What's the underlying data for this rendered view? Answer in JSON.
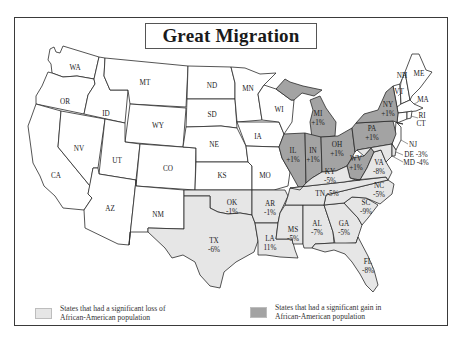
{
  "title": "Great Migration",
  "colors": {
    "loss_fill": "#e6e6e6",
    "gain_fill": "#a3a3a3",
    "neutral_fill": "#ffffff",
    "border": "#2a2a2a"
  },
  "legend": {
    "loss": {
      "line1": "States that had a significant loss of",
      "line2": "African-American population"
    },
    "gain": {
      "line1": "States that had a significant gain in",
      "line2": "African-American population"
    }
  },
  "states": {
    "WA": {
      "abbr": "WA",
      "change": ""
    },
    "OR": {
      "abbr": "OR",
      "change": ""
    },
    "CA": {
      "abbr": "CA",
      "change": ""
    },
    "ID": {
      "abbr": "ID",
      "change": ""
    },
    "NV": {
      "abbr": "NV",
      "change": ""
    },
    "MT": {
      "abbr": "MT",
      "change": ""
    },
    "WY": {
      "abbr": "WY",
      "change": ""
    },
    "UT": {
      "abbr": "UT",
      "change": ""
    },
    "AZ": {
      "abbr": "AZ",
      "change": ""
    },
    "CO": {
      "abbr": "CO",
      "change": ""
    },
    "NM": {
      "abbr": "NM",
      "change": ""
    },
    "ND": {
      "abbr": "ND",
      "change": ""
    },
    "SD": {
      "abbr": "SD",
      "change": ""
    },
    "NE": {
      "abbr": "NE",
      "change": ""
    },
    "KS": {
      "abbr": "KS",
      "change": ""
    },
    "MN": {
      "abbr": "MN",
      "change": ""
    },
    "IA": {
      "abbr": "IA",
      "change": ""
    },
    "MO": {
      "abbr": "MO",
      "change": ""
    },
    "WI": {
      "abbr": "WI",
      "change": ""
    },
    "OK": {
      "abbr": "OK",
      "change": "-1%"
    },
    "TX": {
      "abbr": "TX",
      "change": "-6%"
    },
    "AR": {
      "abbr": "AR",
      "change": "-1%"
    },
    "LA": {
      "abbr": "LA",
      "change": "11%"
    },
    "MS": {
      "abbr": "MS",
      "change": "-5%"
    },
    "AL": {
      "abbr": "AL",
      "change": "-7%"
    },
    "GA": {
      "abbr": "GA",
      "change": "-5%"
    },
    "FL": {
      "abbr": "FL",
      "change": "-8%"
    },
    "SC": {
      "abbr": "SC",
      "change": "-9%"
    },
    "NC": {
      "abbr": "NC",
      "change": "-5%"
    },
    "TN": {
      "abbr": "TN",
      "change": "-5%"
    },
    "KY": {
      "abbr": "KY",
      "change": "-5%"
    },
    "VA": {
      "abbr": "VA",
      "change": "-8%"
    },
    "IL": {
      "abbr": "IL",
      "change": "+1%"
    },
    "IN": {
      "abbr": "IN",
      "change": "+1%"
    },
    "MI": {
      "abbr": "MI",
      "change": "+1%"
    },
    "OH": {
      "abbr": "OH",
      "change": "+1%"
    },
    "WV": {
      "abbr": "WV",
      "change": "+1%"
    },
    "PA": {
      "abbr": "PA",
      "change": "+1%"
    },
    "NY": {
      "abbr": "NY",
      "change": "+1%"
    },
    "NJ": {
      "abbr": "NJ",
      "change": ""
    },
    "DE": {
      "abbr": "DE",
      "change": "-3%"
    },
    "MD": {
      "abbr": "MD",
      "change": "-4%"
    },
    "VT": {
      "abbr": "VT",
      "change": ""
    },
    "NH": {
      "abbr": "NH",
      "change": ""
    },
    "ME": {
      "abbr": "ME",
      "change": ""
    },
    "MA": {
      "abbr": "MA",
      "change": ""
    },
    "RI": {
      "abbr": "RI",
      "change": ""
    },
    "CT": {
      "abbr": "CT",
      "change": ""
    }
  },
  "labels": {
    "TN_full": "TN -5%",
    "DE_full": "DE -3%",
    "MD_full": "MD -4%"
  }
}
